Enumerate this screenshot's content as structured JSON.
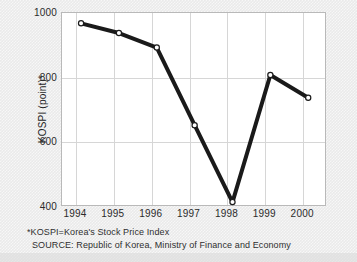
{
  "chart_data": {
    "type": "line",
    "title": "",
    "xlabel": "",
    "ylabel": "KOSPI (point)*",
    "categories": [
      "1994",
      "1995",
      "1996",
      "1997",
      "1998",
      "1999",
      "2000"
    ],
    "values": [
      965,
      935,
      890,
      650,
      412,
      805,
      735
    ],
    "series": [
      {
        "name": "KOSPI",
        "values": [
          965,
          935,
          890,
          650,
          412,
          805,
          735
        ]
      }
    ],
    "ylim": [
      400,
      1000
    ],
    "yticks": [
      "400",
      "600",
      "800",
      "1000"
    ],
    "ytick_values": [
      400,
      600,
      800,
      1000
    ],
    "xticks": [
      "1994",
      "1995",
      "1996",
      "1997",
      "1998",
      "1999",
      "2000"
    ],
    "grid": true,
    "legend": "none",
    "marker": "open-circle",
    "line_color": "#1a1a1a",
    "marker_fill": "#ffffff",
    "grid_color": "#d6d6d6",
    "plot_bg": "#ffffff",
    "figure_bg": "#eaeaea"
  },
  "notes": {
    "footnote": "*KOSPI=Korea's Stock Price Index",
    "source": "SOURCE: Republic of Korea, Ministry of Finance and Economy"
  }
}
